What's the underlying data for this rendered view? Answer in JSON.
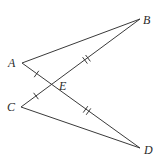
{
  "diagram": {
    "type": "geometry",
    "points": {
      "A": {
        "label": "A",
        "x": 22,
        "y": 63
      },
      "B": {
        "label": "B",
        "x": 140,
        "y": 19
      },
      "C": {
        "label": "C",
        "x": 21,
        "y": 107
      },
      "D": {
        "label": "D",
        "x": 140,
        "y": 148
      },
      "E": {
        "label": "E",
        "x": 51,
        "y": 85
      }
    },
    "segments": [
      {
        "from": "A",
        "to": "B"
      },
      {
        "from": "A",
        "to": "D"
      },
      {
        "from": "C",
        "to": "B"
      },
      {
        "from": "C",
        "to": "D"
      }
    ],
    "tick_marks": [
      {
        "segment": "AE",
        "count": 1
      },
      {
        "segment": "CE",
        "count": 1
      },
      {
        "segment": "BE",
        "count": 2
      },
      {
        "segment": "DE",
        "count": 2
      }
    ],
    "labels": {
      "A": "A",
      "B": "B",
      "C": "C",
      "D": "D",
      "E": "E"
    },
    "colors": {
      "line": "#3a3a3a",
      "text": "#2a2a2a",
      "background": "#ffffff"
    }
  }
}
